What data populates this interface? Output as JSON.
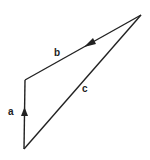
{
  "diagram": {
    "type": "vector-triangle",
    "stroke_color": "#222222",
    "background": "#ffffff",
    "vertices": {
      "bottom": [
        24,
        149
      ],
      "left": [
        25,
        80
      ],
      "top_right": [
        141,
        15
      ]
    },
    "vectors": [
      {
        "name": "a",
        "label": "a",
        "from": "bottom",
        "to": "left",
        "arrow": true
      },
      {
        "name": "b",
        "label": "b",
        "from": "top_right",
        "to": "left",
        "arrow": true
      },
      {
        "name": "c",
        "label": "c",
        "from": "bottom",
        "to": "top_right",
        "arrow": false
      }
    ],
    "labels": {
      "a": "a",
      "b": "b",
      "c": "c"
    }
  }
}
